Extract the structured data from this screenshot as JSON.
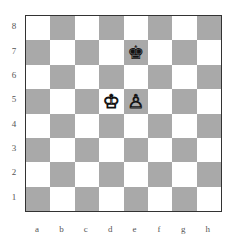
{
  "board": {
    "ranks": [
      "8",
      "7",
      "6",
      "5",
      "4",
      "3",
      "2",
      "1"
    ],
    "files": [
      "a",
      "b",
      "c",
      "d",
      "e",
      "f",
      "g",
      "h"
    ],
    "colors": {
      "light": "#ffffff",
      "dark": "#a9a9a9",
      "border": "#333333"
    },
    "pieces": [
      {
        "square": "e7",
        "color": "black",
        "type": "king",
        "glyph": "♚"
      },
      {
        "square": "d5",
        "color": "white",
        "type": "king",
        "glyph": "♔"
      },
      {
        "square": "e5",
        "color": "white",
        "type": "pawn",
        "glyph": "♙"
      }
    ]
  }
}
